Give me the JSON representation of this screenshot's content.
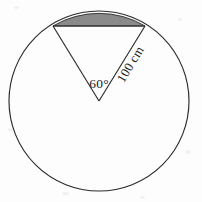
{
  "figure": {
    "background_color": "#fdfdfd",
    "stroke_color": "#2b2b2b",
    "shaded_fill_color": "#8a8a8a",
    "circle": {
      "center_x": 99,
      "center_y": 101,
      "radius": 90
    },
    "sector": {
      "central_angle_degrees": 60,
      "bisector_direction": "up",
      "chord_left_x": 53,
      "chord_left_y": 26,
      "chord_right_x": 145,
      "chord_right_y": 26
    },
    "shaded_region": {
      "name": "circular-segment",
      "description": "region between the chord and the minor arc at the top of the circle"
    },
    "labels": {
      "angle": "60°",
      "radius": "100 cm",
      "angle_x": 99,
      "angle_y": 84,
      "radius_rotation_degrees": -59
    }
  }
}
